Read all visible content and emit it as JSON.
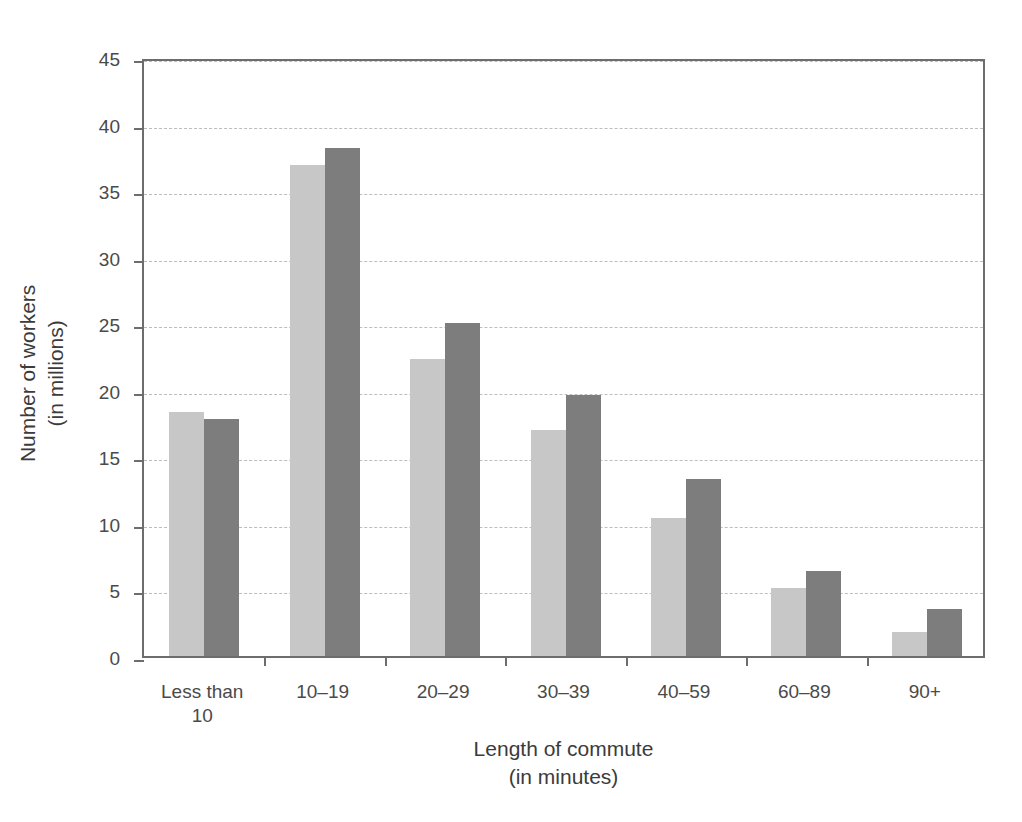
{
  "chart_data": {
    "type": "bar",
    "title": "",
    "xlabel": "Length of commute\n(in minutes)",
    "ylabel": "Number of workers\n(in millions)",
    "categories": [
      "Less than\n10",
      "10–19",
      "20–29",
      "30–39",
      "40–59",
      "60–89",
      "90+"
    ],
    "series": [
      {
        "name": "1990",
        "color": "#c7c7c7",
        "values": [
          18.3,
          36.9,
          22.3,
          17.0,
          10.4,
          5.1,
          1.8
        ]
      },
      {
        "name": "2000",
        "color": "#7d7d7d",
        "values": [
          17.8,
          38.2,
          25.0,
          19.6,
          13.3,
          6.4,
          3.5
        ]
      }
    ],
    "ylim": [
      0,
      45
    ],
    "yticks": [
      0,
      5,
      10,
      15,
      20,
      25,
      30,
      35,
      40,
      45
    ],
    "ytick_labels": [
      "0",
      "5",
      "10",
      "15",
      "20",
      "25",
      "30",
      "35",
      "40",
      "45"
    ],
    "grid": "horizontal-dashed",
    "legend_position": "top-right",
    "frame": true
  },
  "legend": {
    "entries": [
      {
        "label": "1990",
        "color": "#c7c7c7"
      },
      {
        "label": "2000",
        "color": "#7d7d7d"
      }
    ]
  },
  "axes": {
    "y_title": "Number of workers\n(in millions)",
    "x_title": "Length of commute\n(in minutes)"
  },
  "colors": {
    "series_1990": "#c7c7c7",
    "series_2000": "#7d7d7d",
    "axis": "#6d6d6d",
    "gridline": "#bdbdbd",
    "text": "#3b3b3b",
    "background": "#ffffff"
  }
}
